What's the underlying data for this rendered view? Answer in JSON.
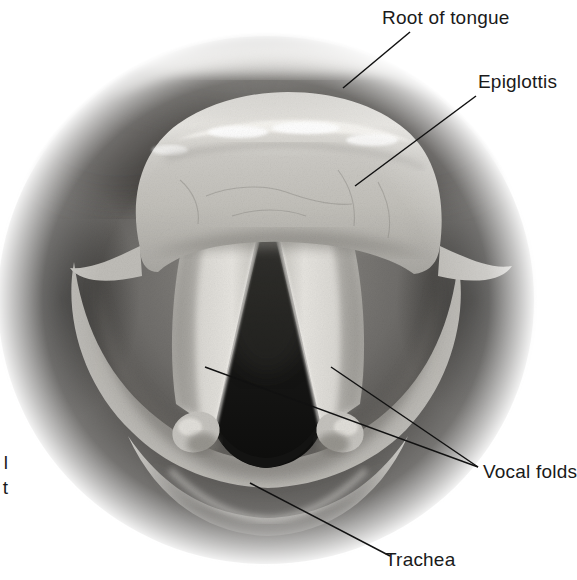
{
  "figure": {
    "type": "anatomical-illustration",
    "background_color": "#ffffff",
    "width": 577,
    "height": 580
  },
  "labels": {
    "root_of_tongue": "Root of tongue",
    "epiglottis": "Epiglottis",
    "vocal_folds": "Vocal folds",
    "trachea": "Trachea",
    "cropped_line_1": "l",
    "cropped_line_2": "t"
  },
  "colors": {
    "text": "#1a1a1a",
    "leader_line": "#111111",
    "background": "#ffffff",
    "tissue_light": "#d8d6d2",
    "tissue_mid": "#9d9b98",
    "tissue_dark": "#4a4845",
    "airway_black": "#191918",
    "fold_highlight": "#eeece8"
  },
  "structures": [
    {
      "name": "root-of-tongue",
      "label": "Root of tongue"
    },
    {
      "name": "epiglottis",
      "label": "Epiglottis"
    },
    {
      "name": "vocal-fold-left",
      "label": "Vocal folds"
    },
    {
      "name": "vocal-fold-right",
      "label": "Vocal folds"
    },
    {
      "name": "trachea",
      "label": "Trachea"
    },
    {
      "name": "arytenoid-tubercle-left",
      "label": ""
    },
    {
      "name": "arytenoid-tubercle-right",
      "label": ""
    },
    {
      "name": "pharyngeal-wall",
      "label": ""
    }
  ],
  "leader_lines": [
    {
      "name": "leader-root-of-tongue",
      "from": [
        343,
        88
      ],
      "to": [
        410,
        32
      ]
    },
    {
      "name": "leader-epiglottis",
      "from": [
        355,
        186
      ],
      "to": [
        476,
        96
      ]
    },
    {
      "name": "leader-vocal-fold-left",
      "from": [
        205,
        367
      ],
      "to": [
        478,
        467
      ]
    },
    {
      "name": "leader-vocal-fold-right",
      "from": [
        331,
        367
      ],
      "to": [
        478,
        467
      ]
    },
    {
      "name": "leader-trachea",
      "from": [
        250,
        483
      ],
      "to": [
        390,
        556
      ]
    }
  ]
}
